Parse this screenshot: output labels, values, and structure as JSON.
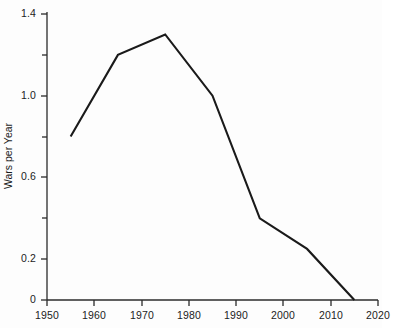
{
  "chart_data": {
    "type": "line",
    "title": "",
    "subtitle": "",
    "xlabel": "",
    "ylabel": "Wars per Year",
    "x": [
      1955,
      1965,
      1975,
      1985,
      1995,
      2005,
      2015
    ],
    "values": [
      0.8,
      1.2,
      1.3,
      1.0,
      0.4,
      0.25,
      0.0
    ],
    "series": [
      {
        "name": "Wars per Year",
        "x": [
          1955,
          1965,
          1975,
          1985,
          1995,
          2005,
          2015
        ],
        "values": [
          0.8,
          1.2,
          1.3,
          1.0,
          0.4,
          0.25,
          0.0
        ]
      }
    ],
    "xlim": [
      1950,
      2020
    ],
    "ylim": [
      0,
      1.4
    ],
    "x_ticks": [
      1950,
      1960,
      1970,
      1980,
      1990,
      2000,
      2010,
      2020
    ],
    "x_tick_labels": [
      "1950",
      "1960",
      "1970",
      "1980",
      "1990",
      "2000",
      "2010",
      "2020"
    ],
    "y_ticks": [
      0,
      0.2,
      0.6,
      1.0,
      1.4
    ],
    "y_tick_labels": [
      "0",
      "0.2",
      "0.6",
      "1.0",
      "1.4"
    ],
    "y_minor_ticks": [
      0.4,
      0.8,
      1.2
    ],
    "grid": false,
    "legend": false,
    "legend_position": "none",
    "line_color": "#1a1a1a",
    "line_width": 2,
    "markers": false,
    "annotations": []
  },
  "axis": {
    "y_label_text": "Wars per Year",
    "y_tick_0": "0",
    "y_tick_1": "0.2",
    "y_tick_2": "0.6",
    "y_tick_3": "1.0",
    "y_tick_4": "1.4",
    "x_tick_0": "1950",
    "x_tick_1": "1960",
    "x_tick_2": "1970",
    "x_tick_3": "1980",
    "x_tick_4": "1990",
    "x_tick_5": "2000",
    "x_tick_6": "2010",
    "x_tick_7": "2020"
  },
  "colors": {
    "background": "#fdfdfd",
    "axis": "#2b2b2b",
    "line": "#1a1a1a",
    "text": "#1c1c1c"
  }
}
